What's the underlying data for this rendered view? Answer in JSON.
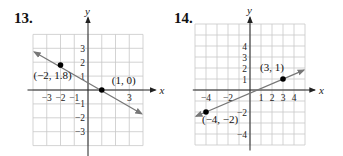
{
  "problems": [
    {
      "number": "13.",
      "left": 14
    },
    {
      "number": "14.",
      "left": 174
    }
  ],
  "colors": {
    "grid": "#c8c8c8",
    "axis": "#222222",
    "line": "#777777",
    "point": "#000000"
  },
  "chart_data": [
    {
      "type": "line",
      "title": "13.",
      "xlabel": "x",
      "ylabel": "y",
      "xlim": [
        -4,
        4
      ],
      "ylim": [
        -4,
        4
      ],
      "grid": true,
      "x_tick_labels": [
        "-3",
        "-2",
        "-1",
        "3"
      ],
      "y_tick_labels": [
        "3",
        "2",
        "1",
        "-1",
        "-2",
        "-3"
      ],
      "points": [
        {
          "x": -2,
          "y": 1.8,
          "label": "(−2, 1.8)"
        },
        {
          "x": 1,
          "y": 0,
          "label": "(1, 0)"
        }
      ],
      "line": {
        "from": [
          -3.9,
          2.73
        ],
        "to": [
          3.9,
          -1.71
        ],
        "slope": -0.6,
        "arrows": "both"
      }
    },
    {
      "type": "line",
      "title": "14.",
      "xlabel": "x",
      "ylabel": "y",
      "xlim": [
        -5,
        5
      ],
      "ylim": [
        -5,
        6
      ],
      "grid": true,
      "x_tick_labels": [
        "-4",
        "-2",
        "1",
        "2",
        "3",
        "4"
      ],
      "y_tick_labels": [
        "4",
        "3",
        "2",
        "1",
        "-2",
        "-4"
      ],
      "points": [
        {
          "x": -4,
          "y": -2,
          "label": "(−4, −2)"
        },
        {
          "x": 3,
          "y": 1,
          "label": "(3, 1)"
        }
      ],
      "line": {
        "from": [
          -4.9,
          -2.386
        ],
        "to": [
          4.9,
          1.814
        ],
        "slope": 0.4286,
        "arrows": "both"
      }
    }
  ]
}
